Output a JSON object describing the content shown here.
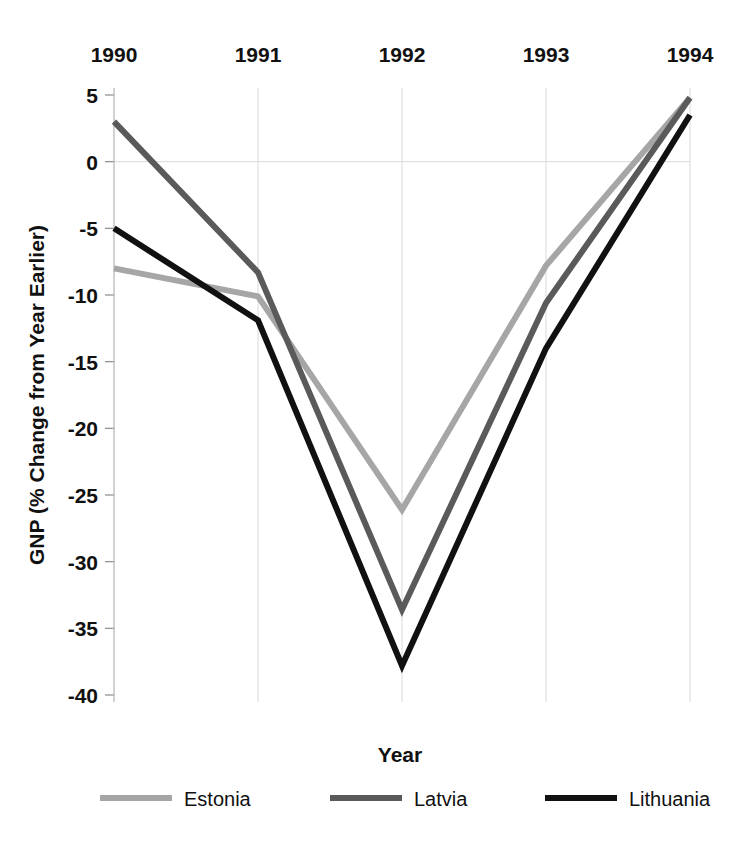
{
  "chart_data": {
    "type": "line",
    "title": "",
    "xlabel": "Year",
    "ylabel": "GNP (% Change from Year Earlier)",
    "categories": [
      "1990",
      "1991",
      "1992",
      "1993",
      "1994"
    ],
    "x": [
      1990,
      1991,
      1992,
      1993,
      1994
    ],
    "xlim": [
      1990,
      1994
    ],
    "ylim": [
      -40,
      5
    ],
    "yticks": [
      5,
      0,
      -5,
      -10,
      -15,
      -20,
      -25,
      -30,
      -35,
      -40
    ],
    "ytick_labels": [
      "5",
      "0",
      "-5",
      "-10",
      "-15",
      "-20",
      "-25",
      "-30",
      "-35",
      "-40"
    ],
    "xticks_position": "top",
    "grid": true,
    "legend_position": "bottom",
    "series": [
      {
        "name": "Estonia",
        "color": "#a6a6a6",
        "width": 6,
        "values": [
          -8.0,
          -10.1,
          -26.1,
          -7.8,
          4.8
        ]
      },
      {
        "name": "Latvia",
        "color": "#5a5a5a",
        "width": 6,
        "values": [
          3.0,
          -8.3,
          -33.6,
          -10.6,
          4.8
        ]
      },
      {
        "name": "Lithuania",
        "color": "#111111",
        "width": 6,
        "values": [
          -5.0,
          -11.9,
          -37.8,
          -14.0,
          3.5
        ]
      }
    ]
  },
  "axis": {
    "x_title": "Year",
    "y_title": "GNP (% Change from Year Earlier)"
  },
  "legend": {
    "entries": [
      {
        "label": "Estonia",
        "color": "#a6a6a6"
      },
      {
        "label": "Latvia",
        "color": "#5a5a5a"
      },
      {
        "label": "Lithuania",
        "color": "#111111"
      }
    ]
  },
  "colors": {
    "estonia": "#a6a6a6",
    "latvia": "#5a5a5a",
    "lithuania": "#111111",
    "grid": "#d9d9d9",
    "axis": "#c8c8c8",
    "text": "#111111",
    "background": "#ffffff"
  }
}
